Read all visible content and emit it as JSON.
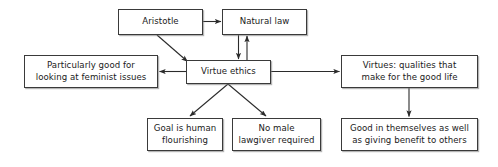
{
  "diagram": {
    "colors": {
      "box_border": "#3a3a3a",
      "box_fill": "#ffffff",
      "edge": "#2b2b2b",
      "text": "#1a1a1a",
      "background": "#ffffff"
    },
    "nodes": [
      {
        "id": "aristotle",
        "label": "Aristotle"
      },
      {
        "id": "natural_law",
        "label": "Natural law"
      },
      {
        "id": "particularly",
        "label": "Particularly good for\nlooking at feminist issues"
      },
      {
        "id": "virtue_ethics",
        "label": "Virtue ethics"
      },
      {
        "id": "virtues",
        "label": "Virtues: qualities that\nmake for the good life"
      },
      {
        "id": "goal",
        "label": "Goal is human\nflourishing"
      },
      {
        "id": "no_male",
        "label": "No male\nlawgiver required"
      },
      {
        "id": "good_in_self",
        "label": "Good in themselves as well\nas giving benefit to others"
      }
    ],
    "edges": [
      {
        "id": "aristotle-to-natural-law",
        "from": "aristotle",
        "to": "natural_law",
        "style": "straight-horizontal",
        "arrow": "end"
      },
      {
        "id": "aristotle-to-virtue-ethics",
        "from": "aristotle",
        "to": "virtue_ethics",
        "style": "diagonal",
        "arrow": "end"
      },
      {
        "id": "natural-law-to-virtue-ethics",
        "from": "natural_law",
        "to": "virtue_ethics",
        "style": "straight-vertical",
        "arrow": "end"
      },
      {
        "id": "virtue-ethics-to-natural-law",
        "from": "virtue_ethics",
        "to": "natural_law",
        "style": "straight-vertical",
        "arrow": "end"
      },
      {
        "id": "virtue-ethics-to-particularly",
        "from": "virtue_ethics",
        "to": "particularly",
        "style": "straight-horizontal",
        "arrow": "end"
      },
      {
        "id": "virtue-ethics-to-virtues",
        "from": "virtue_ethics",
        "to": "virtues",
        "style": "straight-horizontal",
        "arrow": "end"
      },
      {
        "id": "virtue-ethics-to-goal",
        "from": "virtue_ethics",
        "to": "goal",
        "style": "diagonal",
        "arrow": "end"
      },
      {
        "id": "virtue-ethics-to-no-male",
        "from": "virtue_ethics",
        "to": "no_male",
        "style": "diagonal",
        "arrow": "end"
      },
      {
        "id": "virtues-to-good-in-self",
        "from": "virtues",
        "to": "good_in_self",
        "style": "straight-vertical",
        "arrow": "end"
      }
    ]
  }
}
